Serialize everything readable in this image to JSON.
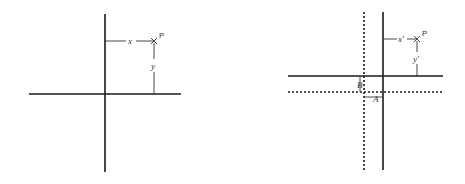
{
  "diagrams": [
    {
      "id": "original-axes",
      "point_label": "P",
      "x_label": "x",
      "y_label": "y"
    },
    {
      "id": "translated-axes",
      "point_label": "P",
      "x_label": "x'",
      "y_label": "y'",
      "offset_labels": {
        "a": "A",
        "b": "B"
      }
    }
  ],
  "colors": {
    "line": "#1a1a1a",
    "text": "#333333",
    "background": "#ffffff"
  }
}
